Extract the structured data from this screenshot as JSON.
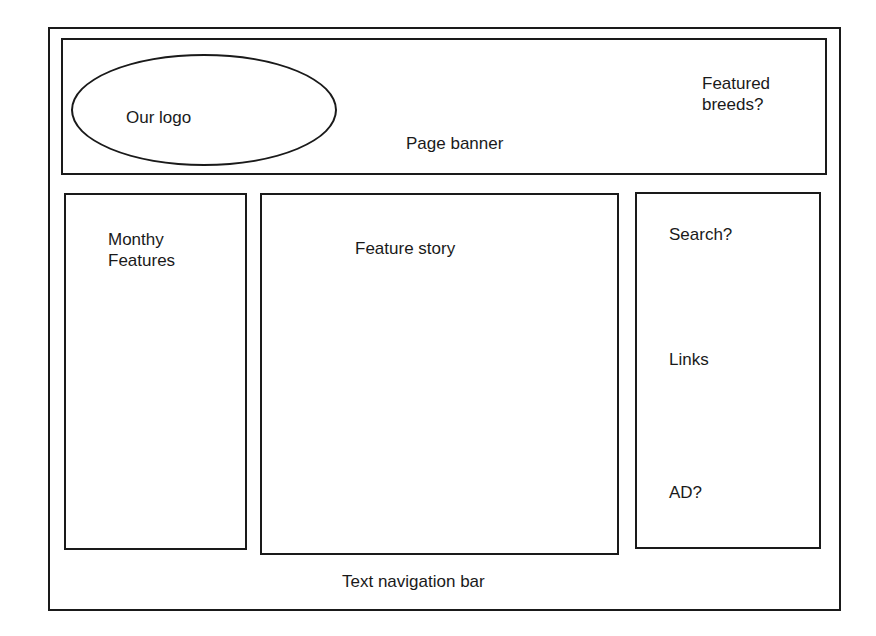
{
  "wireframe": {
    "banner": {
      "label": "Page banner",
      "logo_label": "Our logo",
      "featured_breeds_label": "Featured\nbreeds?"
    },
    "left_column": {
      "label": "Monthy\nFeatures"
    },
    "center_column": {
      "label": "Feature story"
    },
    "right_column": {
      "search_label": "Search?",
      "links_label": "Links",
      "ad_label": "AD?"
    },
    "footer": {
      "label": "Text navigation bar"
    }
  },
  "colors": {
    "stroke": "#1a1a1a",
    "background": "#ffffff"
  }
}
